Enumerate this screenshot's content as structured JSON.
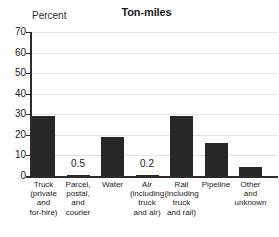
{
  "chart_data": {
    "type": "bar",
    "title": "Ton-miles",
    "ylabel": "Percent",
    "xlabel": "",
    "ylim": [
      0,
      70
    ],
    "ytick_step": 10,
    "yticks": [
      "70",
      "60",
      "50",
      "40",
      "30",
      "20",
      "10",
      "0"
    ],
    "grid": true,
    "legend": "none",
    "categories": [
      "Truck (private and for-hire)",
      "Parcel, postal, and courier",
      "Water",
      "Air (including truck and air)",
      "Rail (including truck and rail)",
      "Pipeline",
      "Other and unknown"
    ],
    "category_lines": [
      [
        "Truck",
        "(private",
        "and",
        "for-hire)"
      ],
      [
        "Parcel,",
        "postal,",
        "and",
        "courier"
      ],
      [
        "Water"
      ],
      [
        "Air",
        "(including",
        "truck",
        "and air)"
      ],
      [
        "Rail",
        "(including",
        "truck",
        "and rail)"
      ],
      [
        "Pipeline"
      ],
      [
        "Other",
        "and",
        "unknown"
      ]
    ],
    "values": [
      29,
      0.5,
      19,
      0.2,
      29,
      16,
      4.5
    ],
    "value_labels": [
      "",
      "0.5",
      "",
      "0.2",
      "",
      "",
      ""
    ],
    "bar_color": "#262626",
    "grid_color": "#e2e2e2",
    "axis_color": "#2b2b2b",
    "text_color": "#1a1a1a"
  }
}
